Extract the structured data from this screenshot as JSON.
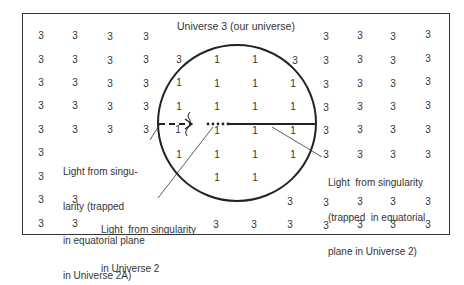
{
  "title": "Universe 3 (our universe)",
  "colors": {
    "ink": "#333333",
    "background": "#ffffff"
  },
  "region_labels": {
    "outside": "3",
    "inside": "1"
  },
  "grid": {
    "outside_points": [
      {
        "x": 41,
        "y": 36
      },
      {
        "x": 75,
        "y": 36
      },
      {
        "x": 110,
        "y": 37
      },
      {
        "x": 146,
        "y": 37
      },
      {
        "x": 326,
        "y": 37
      },
      {
        "x": 360,
        "y": 36
      },
      {
        "x": 393,
        "y": 37
      },
      {
        "x": 428,
        "y": 35
      },
      {
        "x": 41,
        "y": 60
      },
      {
        "x": 75,
        "y": 60
      },
      {
        "x": 110,
        "y": 61
      },
      {
        "x": 146,
        "y": 60
      },
      {
        "x": 179,
        "y": 60
      },
      {
        "x": 295,
        "y": 61
      },
      {
        "x": 326,
        "y": 61
      },
      {
        "x": 360,
        "y": 60
      },
      {
        "x": 393,
        "y": 61
      },
      {
        "x": 428,
        "y": 59
      },
      {
        "x": 41,
        "y": 83
      },
      {
        "x": 75,
        "y": 83
      },
      {
        "x": 110,
        "y": 84
      },
      {
        "x": 146,
        "y": 84
      },
      {
        "x": 326,
        "y": 85
      },
      {
        "x": 360,
        "y": 84
      },
      {
        "x": 393,
        "y": 84
      },
      {
        "x": 428,
        "y": 82
      },
      {
        "x": 41,
        "y": 106
      },
      {
        "x": 75,
        "y": 106
      },
      {
        "x": 110,
        "y": 107
      },
      {
        "x": 146,
        "y": 107
      },
      {
        "x": 326,
        "y": 108
      },
      {
        "x": 360,
        "y": 107
      },
      {
        "x": 393,
        "y": 107
      },
      {
        "x": 428,
        "y": 106
      },
      {
        "x": 41,
        "y": 130
      },
      {
        "x": 75,
        "y": 130
      },
      {
        "x": 110,
        "y": 130
      },
      {
        "x": 146,
        "y": 130
      },
      {
        "x": 326,
        "y": 131
      },
      {
        "x": 360,
        "y": 130
      },
      {
        "x": 393,
        "y": 130
      },
      {
        "x": 428,
        "y": 130
      },
      {
        "x": 41,
        "y": 153
      },
      {
        "x": 326,
        "y": 155
      },
      {
        "x": 360,
        "y": 155
      },
      {
        "x": 393,
        "y": 155
      },
      {
        "x": 428,
        "y": 155
      },
      {
        "x": 41,
        "y": 177
      },
      {
        "x": 41,
        "y": 200
      },
      {
        "x": 75,
        "y": 200
      },
      {
        "x": 290,
        "y": 202
      },
      {
        "x": 326,
        "y": 203
      },
      {
        "x": 360,
        "y": 202
      },
      {
        "x": 393,
        "y": 202
      },
      {
        "x": 428,
        "y": 202
      },
      {
        "x": 41,
        "y": 224
      },
      {
        "x": 75,
        "y": 224
      },
      {
        "x": 216,
        "y": 225
      },
      {
        "x": 254,
        "y": 225
      },
      {
        "x": 290,
        "y": 225
      },
      {
        "x": 326,
        "y": 226
      },
      {
        "x": 360,
        "y": 225
      },
      {
        "x": 393,
        "y": 225
      },
      {
        "x": 428,
        "y": 225
      }
    ],
    "inside_points": [
      {
        "x": 217,
        "y": 60
      },
      {
        "x": 255,
        "y": 60
      },
      {
        "x": 179,
        "y": 83
      },
      {
        "x": 217,
        "y": 84
      },
      {
        "x": 255,
        "y": 84
      },
      {
        "x": 293,
        "y": 84
      },
      {
        "x": 179,
        "y": 107
      },
      {
        "x": 217,
        "y": 107
      },
      {
        "x": 255,
        "y": 107
      },
      {
        "x": 293,
        "y": 107
      },
      {
        "x": 178,
        "y": 130
      },
      {
        "x": 217,
        "y": 131
      },
      {
        "x": 255,
        "y": 131
      },
      {
        "x": 293,
        "y": 131
      },
      {
        "x": 179,
        "y": 155
      },
      {
        "x": 217,
        "y": 155
      },
      {
        "x": 255,
        "y": 155
      },
      {
        "x": 293,
        "y": 155
      },
      {
        "x": 217,
        "y": 178
      },
      {
        "x": 255,
        "y": 178
      }
    ]
  },
  "annotations": {
    "left": {
      "lines": [
        "Light from singu-",
        "larity (trapped",
        "in equatorial plane",
        "in Universe 2A)"
      ]
    },
    "bottom": {
      "lines": [
        "Light  from singularity",
        "in Universe 2"
      ]
    },
    "right": {
      "lines": [
        "Light  from singularity",
        "(trapped  in equatorial",
        "plane in Universe 2)"
      ]
    }
  },
  "figure_elements": {
    "circle": {
      "cx": 237,
      "cy": 123,
      "rx": 79,
      "ry": 78
    },
    "equatorial_line": {
      "x1": 231,
      "x2": 316,
      "y": 124
    },
    "singularity_dots": {
      "x_start": 207,
      "x_end": 228,
      "count": 5,
      "y": 124
    },
    "dashed_arrow": {
      "x1": 160,
      "x2": 192,
      "y": 124
    }
  }
}
